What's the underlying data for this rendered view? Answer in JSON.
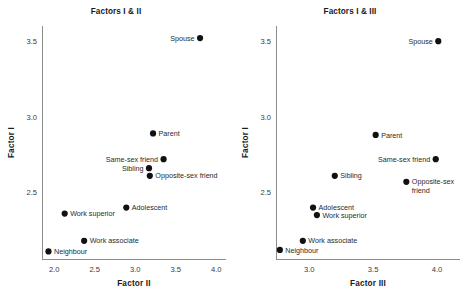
{
  "figure": {
    "background": "#ffffff",
    "dot_color": "#111111",
    "axis_color": "#8c8c8c",
    "text_color": "#1a1a1a"
  },
  "chart_data": [
    {
      "type": "scatter",
      "panel": "left",
      "title": "Factors I & II",
      "xlabel": "Factor II",
      "ylabel": "Factor I",
      "xlim": [
        1.85,
        4.12
      ],
      "ylim": [
        2.06,
        3.6
      ],
      "xticks": [
        2.0,
        2.5,
        3.0,
        3.5,
        4.0
      ],
      "xtick_labels": [
        "2.0",
        "2.5",
        "3.0",
        "3.5",
        "4.0"
      ],
      "yticks": [
        2.5,
        3.0,
        3.5
      ],
      "ytick_labels": [
        "2.5",
        "3.0",
        "3.5"
      ],
      "grid": false,
      "legend": "none",
      "points": [
        {
          "label": "Spouse",
          "x": 3.8,
          "y": 3.52,
          "label_pos": "left",
          "lines": [
            "Spouse"
          ]
        },
        {
          "label": "Parent",
          "x": 3.22,
          "y": 2.89,
          "label_pos": "right",
          "lines": [
            "Parent"
          ]
        },
        {
          "label": "Same-sex friend",
          "x": 3.35,
          "y": 2.72,
          "label_pos": "left",
          "lines": [
            "Same-sex friend"
          ]
        },
        {
          "label": "Sibling",
          "x": 3.17,
          "y": 2.66,
          "label_pos": "left",
          "lines": [
            "Sibling"
          ]
        },
        {
          "label": "Opposite-sex friend",
          "x": 3.18,
          "y": 2.61,
          "label_pos": "right",
          "lines": [
            "Opposite-sex friend"
          ]
        },
        {
          "label": "Adolescent",
          "x": 2.89,
          "y": 2.4,
          "label_pos": "right",
          "lines": [
            "Adolescent"
          ]
        },
        {
          "label": "Work superior",
          "x": 2.13,
          "y": 2.36,
          "label_pos": "right",
          "lines": [
            "Work superior"
          ]
        },
        {
          "label": "Work associate",
          "x": 2.37,
          "y": 2.18,
          "label_pos": "right",
          "lines": [
            "Work associate"
          ]
        },
        {
          "label": "Neighbour",
          "x": 1.93,
          "y": 2.11,
          "label_pos": "right",
          "lines": [
            "Neighbour"
          ]
        }
      ]
    },
    {
      "type": "scatter",
      "panel": "right",
      "title": "Factors I & III",
      "xlabel": "Factor III",
      "ylabel": "Factor I",
      "xlim": [
        2.74,
        4.18
      ],
      "ylim": [
        2.06,
        3.6
      ],
      "xticks": [
        3.0,
        3.5,
        4.0
      ],
      "xtick_labels": [
        "3.0",
        "3.5",
        "4.0"
      ],
      "yticks": [
        2.5,
        3.0,
        3.5
      ],
      "ytick_labels": [
        "2.5",
        "3.0",
        "3.5"
      ],
      "grid": false,
      "legend": "none",
      "points": [
        {
          "label": "Spouse",
          "x": 4.01,
          "y": 3.5,
          "label_pos": "left",
          "lines": [
            "Spouse"
          ]
        },
        {
          "label": "Parent",
          "x": 3.52,
          "y": 2.88,
          "label_pos": "right",
          "lines": [
            "Parent"
          ]
        },
        {
          "label": "Same-sex friend",
          "x": 3.99,
          "y": 2.72,
          "label_pos": "left",
          "lines": [
            "Same-sex friend"
          ]
        },
        {
          "label": "Sibling",
          "x": 3.2,
          "y": 2.61,
          "label_pos": "right",
          "lines": [
            "Sibling"
          ]
        },
        {
          "label": "Opposite-sex friend",
          "x": 3.76,
          "y": 2.57,
          "label_pos": "right",
          "lines": [
            "Opposite-sex",
            "friend"
          ]
        },
        {
          "label": "Adolescent",
          "x": 3.03,
          "y": 2.4,
          "label_pos": "right",
          "lines": [
            "Adolescent"
          ]
        },
        {
          "label": "Work superior",
          "x": 3.06,
          "y": 2.35,
          "label_pos": "right",
          "lines": [
            "Work superior"
          ]
        },
        {
          "label": "Work associate",
          "x": 2.95,
          "y": 2.18,
          "label_pos": "right",
          "lines": [
            "Work associate"
          ]
        },
        {
          "label": "Neighbour",
          "x": 2.77,
          "y": 2.12,
          "label_pos": "right",
          "lines": [
            "Neighbour"
          ]
        }
      ]
    }
  ]
}
